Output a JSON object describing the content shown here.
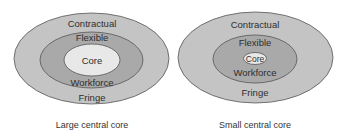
{
  "colors": {
    "outer_ring": "#c4c4c4",
    "middle_ring": "#a9a9a9",
    "core": "#e8e8e8",
    "stroke": "#555555",
    "text": "#2e2e2e",
    "background": "#ffffff"
  },
  "diagrams": [
    {
      "caption": "Large central core",
      "rings": {
        "outer_top": "Contractual",
        "outer_bottom": "Fringe",
        "middle_top": "Flexible",
        "middle_bottom": "Workforce",
        "core": "Core"
      }
    },
    {
      "caption": "Small central core",
      "rings": {
        "outer_top": "Contractual",
        "outer_bottom": "Fringe",
        "middle_top": "Flexible",
        "middle_bottom": "Workforce",
        "core": "Core"
      }
    }
  ]
}
